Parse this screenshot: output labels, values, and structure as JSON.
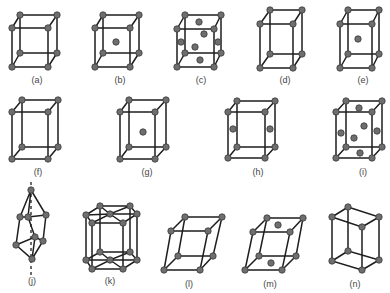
{
  "figure": {
    "cells": [
      {
        "id": "a",
        "label": "(a)"
      },
      {
        "id": "b",
        "label": "(b)"
      },
      {
        "id": "c",
        "label": "(c)"
      },
      {
        "id": "d",
        "label": "(d)"
      },
      {
        "id": "e",
        "label": "(e)"
      },
      {
        "id": "f",
        "label": "(f)"
      },
      {
        "id": "g",
        "label": "(g)"
      },
      {
        "id": "h",
        "label": "(h)"
      },
      {
        "id": "i",
        "label": "(i)"
      },
      {
        "id": "j",
        "label": "(j)"
      },
      {
        "id": "k",
        "label": "(k)"
      },
      {
        "id": "l",
        "label": "(l)"
      },
      {
        "id": "m",
        "label": "(m)"
      },
      {
        "id": "n",
        "label": "(n)"
      }
    ]
  },
  "colors": {
    "edge": "#1e1e1e",
    "atom": "#6e6e6e",
    "label": "#444444",
    "background": "#ffffff"
  }
}
